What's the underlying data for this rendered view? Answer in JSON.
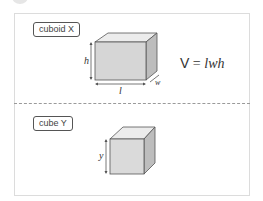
{
  "section_x": {
    "tag": "cuboid X",
    "labels": {
      "height": "h",
      "length": "l",
      "width": "w"
    },
    "formula": {
      "lhs": "V",
      "eq": " = ",
      "rhs": "lwh"
    }
  },
  "section_y": {
    "tag": "cube Y",
    "labels": {
      "side": "y"
    }
  },
  "colors": {
    "face_front": "#d6d6d6",
    "face_top": "#ececec",
    "face_side": "#bdbdbd",
    "edge": "#555555",
    "separator": "#9a9a9a"
  }
}
